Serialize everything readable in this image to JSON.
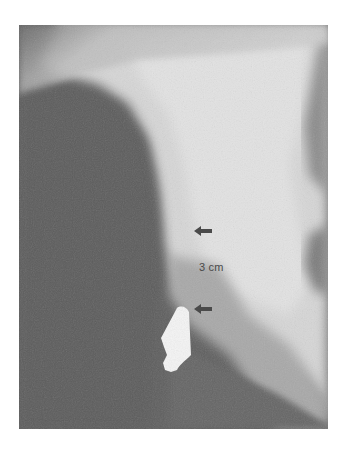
{
  "figure": {
    "type": "radiograph",
    "annotation": {
      "measurement_label": "3 cm"
    },
    "markers": [
      {
        "name": "upper-arrow",
        "direction": "left"
      },
      {
        "name": "lower-arrow",
        "direction": "left"
      }
    ],
    "colors": {
      "background": "#ffffff",
      "dark_soft_tissue": "#5f5f5f",
      "bright_bone": "#d8d8d8",
      "arrow": "#4a4a4a",
      "radiopaque_object": "#f4f4f4"
    }
  }
}
